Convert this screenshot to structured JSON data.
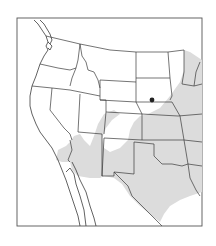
{
  "map": {
    "type": "species-range-map",
    "region": "Western and Central United States with northern Mexico",
    "colors": {
      "background": "#ffffff",
      "range_fill": "#dcdcdc",
      "border": "#3a3a3a",
      "locality_dot": "#222222"
    },
    "legend": {
      "range_label": "Range (shaded)",
      "locality_label": "Locality (dot)"
    },
    "locality_dot": {
      "x": 152,
      "y": 100
    },
    "frame": {
      "x": 17,
      "y": 18,
      "width": 185,
      "height": 208
    }
  }
}
